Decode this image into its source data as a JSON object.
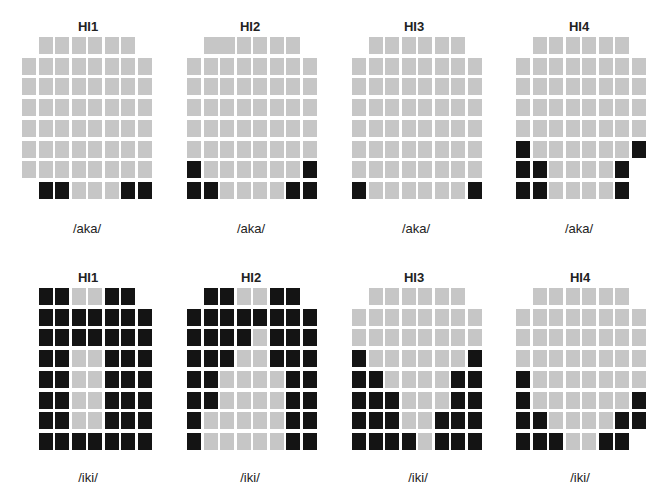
{
  "figure": {
    "legend_colors": {
      "G": "#c6c6c6",
      "B": "#141414"
    },
    "cell": {
      "w": 14,
      "h": 17,
      "pitch_x": 16.5,
      "pitch_y": 20.7
    },
    "panels": [
      {
        "id": "top-hi1",
        "title": "HI1",
        "label": "/aka/",
        "origin": [
          22,
          37
        ],
        "title_pos": [
          88,
          26
        ],
        "label_pos": [
          87,
          228
        ],
        "rows": [
          ".GGGGGG.",
          "GGGGGGGG",
          "GGGGGGGG",
          "GGGGGGGG",
          "GGGGGGGG",
          "GGGGGGGG",
          "GGGGGGGG",
          ".BBGGGBB"
        ]
      },
      {
        "id": "top-hi2",
        "title": "HI2",
        "label": "/aka/",
        "origin": [
          187,
          37
        ],
        "title_pos": [
          250,
          26
        ],
        "label_pos": [
          251,
          228
        ],
        "rows": [
          ".WWGGGG.",
          "GGGGGGGG",
          "GGGGGGGG",
          "GGGGGGGG",
          "GGGGGGGG",
          "GGGGGGGG",
          "BGGGGGGB",
          "BBGGGGBB"
        ]
      },
      {
        "id": "top-hi3",
        "title": "HI3",
        "label": "/aka/",
        "origin": [
          352,
          37
        ],
        "title_pos": [
          414,
          26
        ],
        "label_pos": [
          416,
          228
        ],
        "rows": [
          ".GGGGGG.",
          "GGGGGGGG",
          "GGGGGGGG",
          "GGGGGGGG",
          "GGGGGGGG",
          "GGGGGGGG",
          "GGGGGGGG",
          "BGGGGGGB"
        ]
      },
      {
        "id": "top-hi4",
        "title": "HI4",
        "label": "/aka/",
        "origin": [
          516,
          37
        ],
        "title_pos": [
          579,
          26
        ],
        "label_pos": [
          579,
          228
        ],
        "rows": [
          ".GGGGGG.",
          "GGGGGGGG",
          "GGGGGGGG",
          "GGGGGGGG",
          "GGGGGGGG",
          "BGGGGGGB",
          "BBGGGGB.",
          "BBGGGGB."
        ]
      },
      {
        "id": "bottom-hi1",
        "title": "HI1",
        "label": "/iki/",
        "origin": [
          22,
          288
        ],
        "title_pos": [
          88,
          277
        ],
        "label_pos": [
          88,
          477
        ],
        "rows": [
          ".BBGGBB.",
          ".BBBBBBB",
          ".BBBBBBB",
          ".BBGGBBB",
          ".BBGGBBB",
          ".BBGGBBB",
          ".BBGGBBB",
          ".BBBBBBB"
        ]
      },
      {
        "id": "bottom-hi2",
        "title": "HI2",
        "label": "/iki/",
        "origin": [
          187,
          288
        ],
        "title_pos": [
          251,
          277
        ],
        "label_pos": [
          250,
          477
        ],
        "rows": [
          ".BBGGBB.",
          "BBBBBBBB",
          "BBBBGBBB",
          "BBBGGBBB",
          "BBGGGGBB",
          "BBGGGGBB",
          "BGGGGGBB",
          "BGGGGGBB"
        ]
      },
      {
        "id": "bottom-hi3",
        "title": "HI3",
        "label": "/iki/",
        "origin": [
          352,
          288
        ],
        "title_pos": [
          414,
          277
        ],
        "label_pos": [
          418,
          477
        ],
        "rows": [
          ".GGGGGG.",
          "GGGGGGGG",
          "GGGGGGGG",
          "BGGGGGGB",
          "BBGGGGBB",
          "BBBGGGBB",
          "BBBGGBBB",
          "BBBBGBBB"
        ]
      },
      {
        "id": "bottom-hi4",
        "title": "HI4",
        "label": "/iki/",
        "origin": [
          516,
          288
        ],
        "title_pos": [
          580,
          277
        ],
        "label_pos": [
          580,
          477
        ],
        "rows": [
          ".GGGGGG.",
          "GGGGGGGG",
          "GGGGGGGG",
          "GGGGGGGG",
          "BGGGGGGG",
          "BGGGGGGB",
          "BBGGGGBB",
          "BBBGGBB."
        ]
      }
    ]
  }
}
